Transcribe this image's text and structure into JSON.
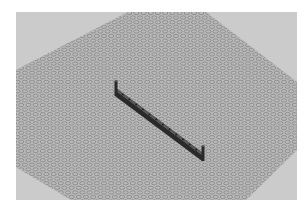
{
  "scene": {
    "description": "3D render of a gray studded baseplate viewed in perspective with a dark beam brick resting on it",
    "frame": {
      "x": 16,
      "y": 12,
      "width": 281,
      "height": 188
    },
    "colors": {
      "page_background": "#ffffff",
      "viewport_background": "#cbcbcb",
      "baseplate": "#b9b9b9",
      "stud_outline": "#858585",
      "beam_dark": "#2a2a2a",
      "beam_top": "#555555",
      "beam_hole": "#1a1a1a"
    },
    "baseplate": {
      "polygon": [
        [
          112,
          0
        ],
        [
          190,
          0
        ],
        [
          281,
          70
        ],
        [
          281,
          138
        ],
        [
          230,
          188
        ],
        [
          55,
          188
        ],
        [
          0,
          155
        ],
        [
          0,
          58
        ]
      ],
      "stud_spacing_x": 7.2,
      "stud_spacing_y": 4.6,
      "stud_rx": 2.6,
      "stud_ry": 1.7
    },
    "beam": {
      "start": [
        99,
        78
      ],
      "end": [
        186,
        143
      ],
      "thickness": 6,
      "post_height": 9,
      "hole_count": 13,
      "label": "beam brick"
    }
  }
}
